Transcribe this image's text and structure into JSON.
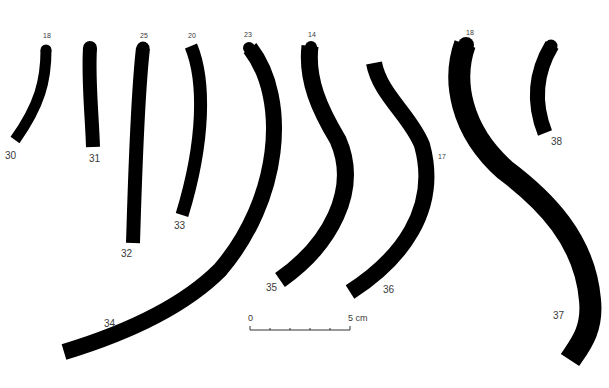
{
  "figure": {
    "items": [
      {
        "id": "30",
        "label": "30",
        "top_value": "18"
      },
      {
        "id": "31",
        "label": "31",
        "top_value": ""
      },
      {
        "id": "32",
        "label": "32",
        "top_value": "25"
      },
      {
        "id": "33",
        "label": "33",
        "top_value": "20"
      },
      {
        "id": "34",
        "label": "34",
        "top_value": "23"
      },
      {
        "id": "35",
        "label": "35",
        "top_value": "14"
      },
      {
        "id": "36",
        "label": "36",
        "top_value": ""
      },
      {
        "id": "37",
        "label": "37",
        "top_value": "18"
      },
      {
        "id": "38",
        "label": "38",
        "top_value": ""
      }
    ],
    "side_value_17": "17",
    "scale_bar": {
      "start_label": "0",
      "end_label": "5 cm",
      "divisions": 5
    },
    "fill_color": "#000000",
    "label_color": "#3a3a3a"
  }
}
